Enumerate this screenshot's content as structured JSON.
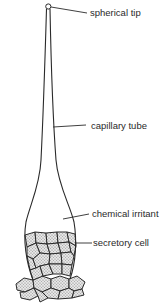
{
  "diagram": {
    "labels": [
      {
        "id": "spherical-tip",
        "text": "spherical tip"
      },
      {
        "id": "capillary-tube",
        "text": "capillary tube"
      },
      {
        "id": "chemical-irritant",
        "text": "chemical irritant"
      },
      {
        "id": "secretory-cell",
        "text": "secretory cell"
      }
    ],
    "colors": {
      "line": "#2a2a2a",
      "cell_fill": "#cfcfcf",
      "background": "#ffffff"
    }
  }
}
